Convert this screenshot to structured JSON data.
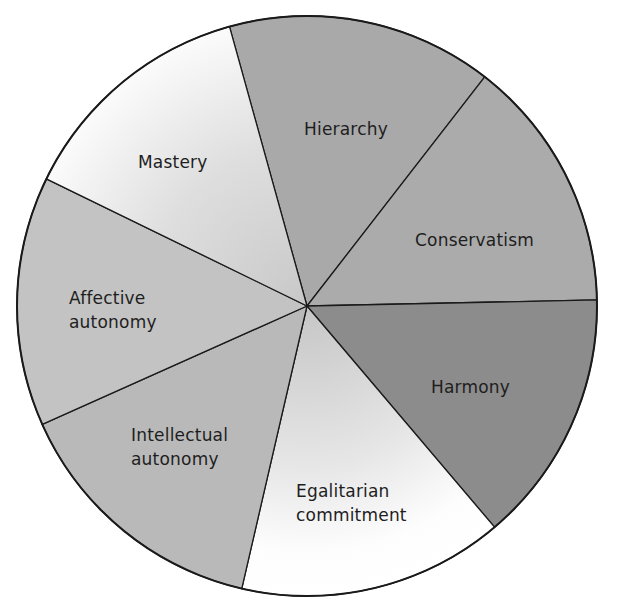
{
  "chart_data": {
    "type": "pie",
    "title": "",
    "center": [
      307,
      306
    ],
    "radius": 290,
    "start_angle_deg": -105.5,
    "slices": [
      {
        "label": "Hierarchy",
        "value": 14.8,
        "start": -105.5,
        "end": -52.2,
        "fill": "#a9a9a9",
        "gradient": false
      },
      {
        "label": "Conservatism",
        "value": 14.2,
        "start": -52.2,
        "end": -1.2,
        "fill": "#ababab",
        "gradient": false
      },
      {
        "label": "Harmony",
        "value": 14.1,
        "start": -1.2,
        "end": 49.7,
        "fill": "#8c8c8c",
        "gradient": false
      },
      {
        "label": "Egalitarian commitment",
        "value": 14.8,
        "start": 49.7,
        "end": 103.0,
        "fill": "#ffffff",
        "gradient": true
      },
      {
        "label": "Intellectual autonomy",
        "value": 14.7,
        "start": 103.0,
        "end": 155.9,
        "fill": "#b9b9b9",
        "gradient": false
      },
      {
        "label": "Affective autonomy",
        "value": 13.9,
        "start": 155.9,
        "end": 206.0,
        "fill": "#c3c3c3",
        "gradient": false
      },
      {
        "label": "Mastery",
        "value": 13.5,
        "start": 206.0,
        "end": 254.5,
        "fill": "#f4f4f4",
        "gradient": true
      }
    ],
    "legend": "none (labels inside slices)"
  },
  "labels": {
    "hierarchy": "Hierarchy",
    "conservatism": "Conservatism",
    "harmony": "Harmony",
    "egalitarian_line1": "Egalitarian",
    "egalitarian_line2": "commitment",
    "intellectual_line1": "Intellectual",
    "intellectual_line2": "autonomy",
    "affective_line1": "Affective",
    "affective_line2": "autonomy",
    "mastery": "Mastery"
  }
}
